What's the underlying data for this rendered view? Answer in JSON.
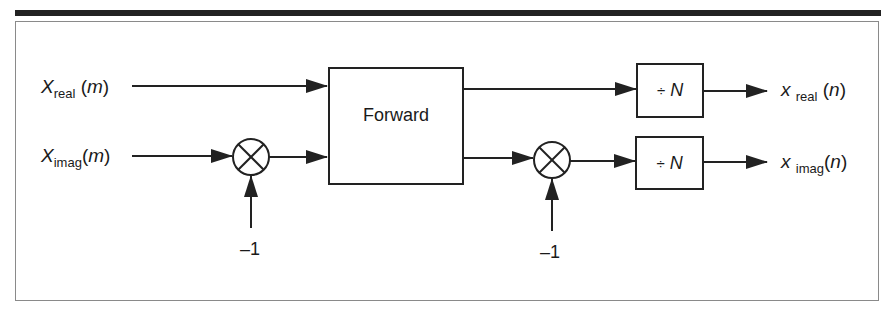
{
  "diagram": {
    "inputs": [
      {
        "symbol": "X",
        "subscript": "real",
        "arg": "m",
        "open": "(",
        "close": ")"
      },
      {
        "symbol": "X",
        "subscript": "imag",
        "arg": "m",
        "open": "(",
        "close": ")"
      }
    ],
    "outputs": [
      {
        "symbol": "x",
        "subscript": "real",
        "arg": "n",
        "open": "(",
        "close": ")"
      },
      {
        "symbol": "x",
        "subscript": "imag",
        "arg": "n",
        "open": "(",
        "close": ")"
      }
    ],
    "blocks": {
      "transform": "Forward",
      "divide_symbol": "÷",
      "divide_var": "N"
    },
    "multipliers": [
      {
        "symbol": "⊗",
        "operand": "–1"
      },
      {
        "symbol": "⊗",
        "operand": "–1"
      }
    ],
    "colors": {
      "stroke": "#222222",
      "frame": "#8a8a8a",
      "background": "#ffffff"
    }
  }
}
